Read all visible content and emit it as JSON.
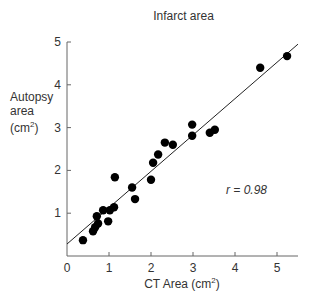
{
  "chart_data": {
    "type": "scatter",
    "title": "Infarct area",
    "xlabel": "CT Area (cm²)",
    "ylabel": "Autopsy area (cm²)",
    "xlim": [
      0,
      5.5
    ],
    "ylim": [
      0,
      5
    ],
    "x_ticks": [
      "0",
      "1",
      "2",
      "3",
      "4",
      "5"
    ],
    "y_ticks": [
      "1",
      "2",
      "3",
      "4",
      "5"
    ],
    "grid": false,
    "legend": null,
    "annotation": "r = 0.98",
    "series": [
      {
        "name": "Infarct area",
        "points": [
          [
            0.38,
            0.37
          ],
          [
            0.62,
            0.58
          ],
          [
            0.67,
            0.67
          ],
          [
            0.74,
            0.76
          ],
          [
            0.71,
            0.93
          ],
          [
            0.86,
            1.07
          ],
          [
            0.98,
            0.81
          ],
          [
            1.02,
            1.07
          ],
          [
            1.12,
            1.14
          ],
          [
            1.14,
            1.84
          ],
          [
            1.55,
            1.6
          ],
          [
            1.62,
            1.33
          ],
          [
            2.0,
            1.78
          ],
          [
            2.05,
            2.18
          ],
          [
            2.17,
            2.37
          ],
          [
            2.33,
            2.65
          ],
          [
            2.52,
            2.6
          ],
          [
            2.98,
            3.07
          ],
          [
            2.98,
            2.81
          ],
          [
            3.4,
            2.88
          ],
          [
            3.52,
            2.95
          ],
          [
            4.6,
            4.4
          ],
          [
            5.24,
            4.67
          ]
        ]
      }
    ],
    "regression_line": {
      "x": [
        0,
        5.5
      ],
      "y": [
        0.28,
        4.95
      ]
    }
  },
  "labels": {
    "title": "Infarct area",
    "ylabel_line1": "Autopsy",
    "ylabel_line2": "area",
    "ylabel_line3_prefix": "(cm",
    "ylabel_line3_sup": "2",
    "ylabel_line3_suffix": ")",
    "xlabel_prefix": "CT Area (cm",
    "xlabel_sup": "2",
    "xlabel_suffix": ")",
    "r_value": "r = 0.98"
  }
}
